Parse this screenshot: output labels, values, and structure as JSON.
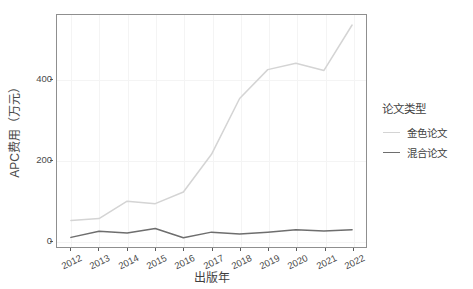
{
  "chart_data": {
    "type": "line",
    "title": "",
    "xlabel": "出版年",
    "ylabel": "APC费用（万元）",
    "x": [
      "2012",
      "2013",
      "2014",
      "2015",
      "2016",
      "2017",
      "2018",
      "2019",
      "2020",
      "2021",
      "2022"
    ],
    "xtick_labels": [
      "2012",
      "2013",
      "2014",
      "2015",
      "2016",
      "2017",
      "2018",
      "2019",
      "2020",
      "2021",
      "2022"
    ],
    "ytick_labels": [
      "0",
      "200",
      "400"
    ],
    "ytick_values": [
      0,
      200,
      400
    ],
    "ylim": [
      -18,
      560
    ],
    "grid": true,
    "grid_color": "#f4f4f4",
    "panel_border_color": "#8f8f8f",
    "legend_position": "right",
    "series": [
      {
        "name": "金色论文",
        "color": "#d4d4d4",
        "values": [
          48,
          53,
          96,
          90,
          119,
          213,
          352,
          424,
          440,
          422,
          535
        ]
      },
      {
        "name": "混合论文",
        "color": "#6e6e6e",
        "values": [
          6,
          21,
          17,
          28,
          5,
          19,
          14,
          19,
          25,
          22,
          25
        ]
      }
    ]
  },
  "legend": {
    "title": "论文类型",
    "items": [
      {
        "label": "金色论文",
        "color": "#d4d4d4"
      },
      {
        "label": "混合论文",
        "color": "#6e6e6e"
      }
    ]
  },
  "axes": {
    "x_title": "出版年",
    "y_title": "APC费用（万元）"
  }
}
